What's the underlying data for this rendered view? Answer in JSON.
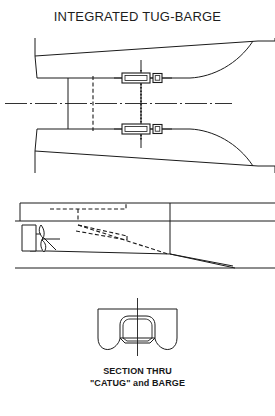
{
  "figure": {
    "title": "INTEGRATED TUG-BARGE",
    "caption_line_1": "SECTION THRU",
    "caption_line_2": "\"CATUG\" and  BARGE",
    "ink_color": "#1b1b1b",
    "background_color": "#ffffff"
  },
  "views": {
    "plan": {
      "name": "plan-view",
      "description": "Plan view of barge stern notch with tug hull and two coupling pin fittings on the notch bulkhead",
      "elements": {
        "barge_wing_upper": "upper barge stern wing",
        "barge_wing_lower": "lower barge stern wing",
        "notch_curve_upper": "upper notch side curving aft",
        "notch_curve_lower": "lower notch side curving aft",
        "centerline": "longitudinal centerline",
        "bulkhead_solid": "solid transverse station line",
        "bulkhead_dashed": "hidden transverse station line",
        "pin_axis": "coupling pin vertical axis",
        "coupling_upper": "upper coupling pin fitting",
        "coupling_lower": "lower coupling pin fitting"
      }
    },
    "profile": {
      "name": "profile-view",
      "description": "Side elevation of tug in barge notch showing deck line, waterline, baseline, rudder, propeller and hidden notch outline",
      "elements": {
        "deck_line": "deck line",
        "waterline": "waterline",
        "baseline": "baseline",
        "notch_hidden": "hidden notch outline",
        "skeg_hidden": "hidden skeg and shaft lines",
        "rudder": "rudder",
        "propeller": "propeller",
        "shaft": "propeller shaft",
        "transom": "barge transom / notch bulkhead",
        "stern_slope": "barge bottom rake aft"
      }
    },
    "section": {
      "name": "section-view",
      "description": "Transverse section through CATUG and barge showing barge box section with rounded bilges and tug hull seated in notch",
      "elements": {
        "barge_section": "barge hull section",
        "tug_section": "tug hull section in notch",
        "centerline": "vertical centerline"
      }
    }
  }
}
